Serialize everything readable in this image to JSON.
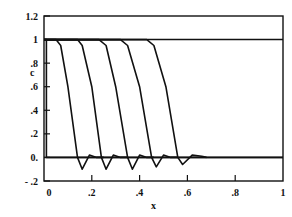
{
  "chart_data": {
    "type": "line",
    "title": "",
    "xlabel": "x",
    "ylabel": "c",
    "xlim": [
      0,
      1
    ],
    "ylim": [
      -0.2,
      1.2
    ],
    "grid": false,
    "legend": null,
    "x_ticks": [
      "0",
      ".2",
      ".4",
      ".6",
      ".8",
      "1"
    ],
    "y_ticks": [
      "- .2",
      "0.",
      ".2",
      ".4",
      ".6",
      ".8",
      "1",
      "1.2"
    ],
    "reference_lines": [
      {
        "axis": "y",
        "value": 0
      },
      {
        "axis": "y",
        "value": 1
      }
    ],
    "series": [
      {
        "name": "t0",
        "x": [
          0.0,
          0.01,
          0.01,
          1.0
        ],
        "y": [
          1,
          1,
          0,
          0
        ]
      },
      {
        "name": "t1",
        "x": [
          0.0,
          0.05,
          0.07,
          0.1,
          0.14,
          0.16,
          0.19,
          0.22,
          0.25
        ],
        "y": [
          1,
          1,
          0.95,
          0.6,
          0,
          -0.1,
          0.02,
          0,
          0
        ]
      },
      {
        "name": "t2",
        "x": [
          0.0,
          0.14,
          0.16,
          0.2,
          0.24,
          0.26,
          0.29,
          0.32,
          0.35
        ],
        "y": [
          1,
          1,
          0.95,
          0.6,
          0,
          -0.1,
          0.02,
          0,
          0
        ]
      },
      {
        "name": "t3",
        "x": [
          0.0,
          0.23,
          0.26,
          0.3,
          0.35,
          0.37,
          0.4,
          0.43,
          0.46
        ],
        "y": [
          1,
          1,
          0.95,
          0.6,
          0,
          -0.1,
          0.02,
          0,
          0
        ]
      },
      {
        "name": "t4",
        "x": [
          0.0,
          0.32,
          0.35,
          0.4,
          0.45,
          0.47,
          0.5,
          0.53,
          0.56
        ],
        "y": [
          1,
          1,
          0.95,
          0.6,
          0,
          -0.08,
          0.02,
          0,
          0
        ]
      },
      {
        "name": "t5",
        "x": [
          0.0,
          0.43,
          0.46,
          0.51,
          0.56,
          0.58,
          0.62,
          0.66,
          0.68
        ],
        "y": [
          1,
          1,
          0.95,
          0.6,
          0,
          -0.06,
          0.02,
          0.01,
          0
        ]
      }
    ]
  },
  "axes": {
    "xlabel": "x",
    "ylabel": "c"
  }
}
